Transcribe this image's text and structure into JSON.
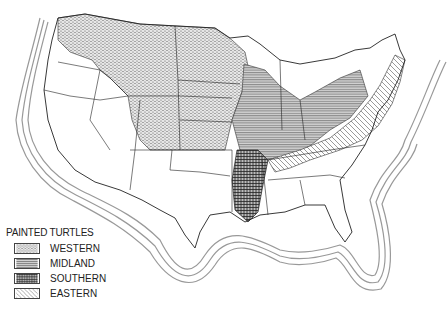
{
  "map": {
    "subject": "Painted turtle subspecies ranges, United States",
    "colors": {
      "background": "#ffffff",
      "outline": "#222222",
      "coast_rings": "#888888",
      "western_fill": "#cfcfcf",
      "midland_fill": "#bdbdbd",
      "southern_fill": "#9a9a9a",
      "eastern_fill": "#ffffff"
    }
  },
  "legend": {
    "title": "PAINTED TURTLES",
    "items": [
      {
        "label": "WESTERN",
        "pattern": "dotted"
      },
      {
        "label": "MIDLAND",
        "pattern": "horizontal-lines"
      },
      {
        "label": "SOUTHERN",
        "pattern": "grid"
      },
      {
        "label": "EASTERN",
        "pattern": "diagonal-lines"
      }
    ]
  }
}
